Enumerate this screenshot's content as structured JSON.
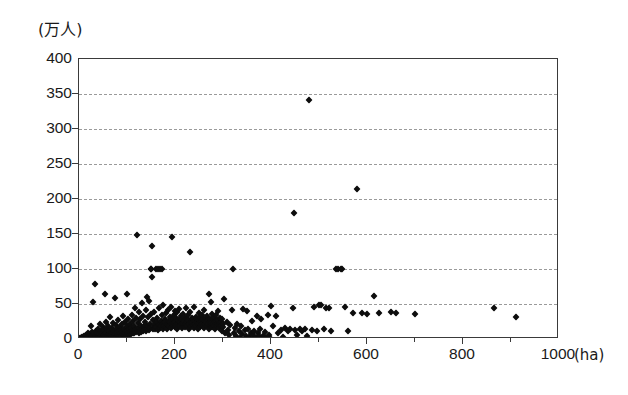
{
  "chart_data": {
    "type": "scatter",
    "title": "",
    "subtitle": "",
    "xlabel": "(ha)",
    "ylabel": "(万人)",
    "x_unit": "ha",
    "y_unit": "万人",
    "xlim": [
      0,
      1000
    ],
    "ylim": [
      0,
      400
    ],
    "x_ticks": [
      0,
      200,
      400,
      600,
      800,
      1000
    ],
    "x_tick_labels": [
      "0",
      "200",
      "400",
      "600",
      "800",
      "1000"
    ],
    "y_ticks": [
      0,
      50,
      100,
      150,
      200,
      250,
      300,
      350,
      400
    ],
    "y_tick_labels": [
      "0",
      "50",
      "100",
      "150",
      "200",
      "250",
      "300",
      "350",
      "400"
    ],
    "x_minor_ticks": [
      100,
      300,
      500,
      700,
      900
    ],
    "grid": true,
    "grid_axis": "y",
    "grid_style": "dashed",
    "grid_color": "#9a9a9a",
    "legend": null,
    "legend_position": "none",
    "marker": "diamond",
    "marker_color": "#0d0d0d",
    "marker_size": 5,
    "frame_color": "#3a3a3a",
    "background": "#ffffff",
    "n_points": 420,
    "notable_outliers": [
      {
        "x": 480,
        "y": 341
      },
      {
        "x": 580,
        "y": 215
      },
      {
        "x": 447,
        "y": 180
      },
      {
        "x": 121,
        "y": 148
      },
      {
        "x": 193,
        "y": 146
      },
      {
        "x": 152,
        "y": 133
      },
      {
        "x": 232,
        "y": 124
      }
    ],
    "points": [
      [
        3,
        1
      ],
      [
        5,
        2
      ],
      [
        6,
        1
      ],
      [
        7,
        3
      ],
      [
        8,
        1
      ],
      [
        9,
        2
      ],
      [
        10,
        4
      ],
      [
        11,
        1
      ],
      [
        12,
        3
      ],
      [
        13,
        2
      ],
      [
        14,
        6
      ],
      [
        15,
        1
      ],
      [
        16,
        4
      ],
      [
        17,
        2
      ],
      [
        18,
        8
      ],
      [
        19,
        3
      ],
      [
        20,
        2
      ],
      [
        21,
        5
      ],
      [
        22,
        1
      ],
      [
        23,
        7
      ],
      [
        24,
        3
      ],
      [
        25,
        18
      ],
      [
        26,
        2
      ],
      [
        27,
        10
      ],
      [
        28,
        4
      ],
      [
        29,
        6
      ],
      [
        30,
        53
      ],
      [
        31,
        3
      ],
      [
        32,
        9
      ],
      [
        33,
        2
      ],
      [
        34,
        79
      ],
      [
        35,
        5
      ],
      [
        36,
        12
      ],
      [
        37,
        3
      ],
      [
        38,
        8
      ],
      [
        39,
        2
      ],
      [
        40,
        15
      ],
      [
        41,
        4
      ],
      [
        42,
        7
      ],
      [
        43,
        3
      ],
      [
        44,
        22
      ],
      [
        45,
        6
      ],
      [
        46,
        11
      ],
      [
        47,
        2
      ],
      [
        48,
        9
      ],
      [
        49,
        4
      ],
      [
        50,
        17
      ],
      [
        51,
        3
      ],
      [
        52,
        13
      ],
      [
        53,
        6
      ],
      [
        54,
        64
      ],
      [
        55,
        4
      ],
      [
        56,
        25
      ],
      [
        57,
        8
      ],
      [
        58,
        5
      ],
      [
        59,
        14
      ],
      [
        60,
        3
      ],
      [
        61,
        19
      ],
      [
        62,
        7
      ],
      [
        63,
        11
      ],
      [
        64,
        5
      ],
      [
        65,
        31
      ],
      [
        66,
        9
      ],
      [
        67,
        6
      ],
      [
        68,
        16
      ],
      [
        69,
        4
      ],
      [
        70,
        23
      ],
      [
        71,
        8
      ],
      [
        72,
        12
      ],
      [
        73,
        5
      ],
      [
        74,
        58
      ],
      [
        75,
        10
      ],
      [
        76,
        7
      ],
      [
        77,
        20
      ],
      [
        78,
        3
      ],
      [
        79,
        14
      ],
      [
        80,
        9
      ],
      [
        81,
        6
      ],
      [
        82,
        27
      ],
      [
        83,
        11
      ],
      [
        84,
        5
      ],
      [
        85,
        17
      ],
      [
        86,
        8
      ],
      [
        87,
        13
      ],
      [
        88,
        4
      ],
      [
        89,
        21
      ],
      [
        90,
        10
      ],
      [
        91,
        7
      ],
      [
        92,
        33
      ],
      [
        93,
        15
      ],
      [
        94,
        6
      ],
      [
        95,
        24
      ],
      [
        96,
        9
      ],
      [
        97,
        12
      ],
      [
        98,
        5
      ],
      [
        99,
        18
      ],
      [
        100,
        65
      ],
      [
        101,
        11
      ],
      [
        102,
        8
      ],
      [
        103,
        29
      ],
      [
        104,
        14
      ],
      [
        105,
        6
      ],
      [
        106,
        22
      ],
      [
        107,
        10
      ],
      [
        108,
        16
      ],
      [
        109,
        7
      ],
      [
        110,
        35
      ],
      [
        111,
        12
      ],
      [
        112,
        9
      ],
      [
        113,
        26
      ],
      [
        114,
        18
      ],
      [
        115,
        8
      ],
      [
        116,
        45
      ],
      [
        117,
        13
      ],
      [
        118,
        10
      ],
      [
        119,
        30
      ],
      [
        120,
        15
      ],
      [
        121,
        148
      ],
      [
        122,
        11
      ],
      [
        123,
        23
      ],
      [
        124,
        9
      ],
      [
        125,
        38
      ],
      [
        126,
        16
      ],
      [
        127,
        12
      ],
      [
        128,
        28
      ],
      [
        129,
        19
      ],
      [
        130,
        10
      ],
      [
        131,
        52
      ],
      [
        132,
        14
      ],
      [
        133,
        11
      ],
      [
        134,
        33
      ],
      [
        135,
        17
      ],
      [
        136,
        13
      ],
      [
        137,
        25
      ],
      [
        138,
        20
      ],
      [
        139,
        12
      ],
      [
        140,
        41
      ],
      [
        141,
        15
      ],
      [
        142,
        60
      ],
      [
        143,
        31
      ],
      [
        144,
        18
      ],
      [
        145,
        13
      ],
      [
        146,
        55
      ],
      [
        147,
        21
      ],
      [
        148,
        16
      ],
      [
        149,
        36
      ],
      [
        150,
        100
      ],
      [
        151,
        100
      ],
      [
        152,
        133
      ],
      [
        153,
        88
      ],
      [
        154,
        14
      ],
      [
        155,
        27
      ],
      [
        156,
        19
      ],
      [
        157,
        39
      ],
      [
        158,
        22
      ],
      [
        159,
        15
      ],
      [
        160,
        100
      ],
      [
        161,
        17
      ],
      [
        162,
        30
      ],
      [
        163,
        24
      ],
      [
        164,
        13
      ],
      [
        165,
        100
      ],
      [
        166,
        20
      ],
      [
        167,
        44
      ],
      [
        168,
        16
      ],
      [
        169,
        100
      ],
      [
        170,
        26
      ],
      [
        171,
        18
      ],
      [
        172,
        34
      ],
      [
        173,
        100
      ],
      [
        174,
        21
      ],
      [
        175,
        15
      ],
      [
        176,
        48
      ],
      [
        177,
        23
      ],
      [
        178,
        19
      ],
      [
        179,
        29
      ],
      [
        180,
        25
      ],
      [
        181,
        17
      ],
      [
        182,
        37
      ],
      [
        183,
        22
      ],
      [
        184,
        14
      ],
      [
        185,
        42
      ],
      [
        186,
        20
      ],
      [
        187,
        26
      ],
      [
        188,
        18
      ],
      [
        189,
        32
      ],
      [
        190,
        24
      ],
      [
        191,
        16
      ],
      [
        192,
        46
      ],
      [
        193,
        146
      ],
      [
        194,
        21
      ],
      [
        195,
        28
      ],
      [
        196,
        19
      ],
      [
        197,
        35
      ],
      [
        198,
        23
      ],
      [
        199,
        17
      ],
      [
        200,
        40
      ],
      [
        201,
        25
      ],
      [
        202,
        30
      ],
      [
        203,
        20
      ],
      [
        204,
        15
      ],
      [
        205,
        38
      ],
      [
        206,
        22
      ],
      [
        207,
        27
      ],
      [
        208,
        18
      ],
      [
        209,
        43
      ],
      [
        210,
        24
      ],
      [
        211,
        19
      ],
      [
        212,
        33
      ],
      [
        213,
        28
      ],
      [
        214,
        21
      ],
      [
        215,
        16
      ],
      [
        216,
        36
      ],
      [
        217,
        23
      ],
      [
        218,
        31
      ],
      [
        219,
        26
      ],
      [
        220,
        20
      ],
      [
        221,
        17
      ],
      [
        222,
        45
      ],
      [
        223,
        22
      ],
      [
        224,
        29
      ],
      [
        225,
        24
      ],
      [
        226,
        18
      ],
      [
        227,
        34
      ],
      [
        228,
        27
      ],
      [
        229,
        21
      ],
      [
        230,
        15
      ],
      [
        231,
        39
      ],
      [
        232,
        124
      ],
      [
        233,
        25
      ],
      [
        234,
        19
      ],
      [
        235,
        30
      ],
      [
        236,
        23
      ],
      [
        237,
        28
      ],
      [
        238,
        20
      ],
      [
        239,
        16
      ],
      [
        240,
        46
      ],
      [
        241,
        26
      ],
      [
        242,
        22
      ],
      [
        243,
        32
      ],
      [
        244,
        18
      ],
      [
        245,
        24
      ],
      [
        246,
        29
      ],
      [
        247,
        21
      ],
      [
        248,
        14
      ],
      [
        249,
        37
      ],
      [
        250,
        27
      ],
      [
        251,
        23
      ],
      [
        252,
        17
      ],
      [
        253,
        31
      ],
      [
        254,
        25
      ],
      [
        255,
        20
      ],
      [
        256,
        35
      ],
      [
        257,
        22
      ],
      [
        258,
        28
      ],
      [
        259,
        19
      ],
      [
        260,
        16
      ],
      [
        261,
        42
      ],
      [
        262,
        26
      ],
      [
        263,
        21
      ],
      [
        264,
        30
      ],
      [
        265,
        24
      ],
      [
        266,
        18
      ],
      [
        267,
        33
      ],
      [
        268,
        27
      ],
      [
        269,
        22
      ],
      [
        270,
        65
      ],
      [
        271,
        15
      ],
      [
        272,
        29
      ],
      [
        273,
        25
      ],
      [
        274,
        20
      ],
      [
        275,
        53
      ],
      [
        276,
        23
      ],
      [
        277,
        17
      ],
      [
        278,
        36
      ],
      [
        279,
        28
      ],
      [
        280,
        21
      ],
      [
        281,
        19
      ],
      [
        282,
        31
      ],
      [
        283,
        24
      ],
      [
        284,
        14
      ],
      [
        285,
        34
      ],
      [
        286,
        26
      ],
      [
        287,
        22
      ],
      [
        288,
        18
      ],
      [
        289,
        40
      ],
      [
        290,
        27
      ],
      [
        291,
        20
      ],
      [
        292,
        16
      ],
      [
        293,
        30
      ],
      [
        294,
        23
      ],
      [
        295,
        25
      ],
      [
        296,
        19
      ],
      [
        297,
        12
      ],
      [
        298,
        28
      ],
      [
        299,
        21
      ],
      [
        300,
        17
      ],
      [
        302,
        57
      ],
      [
        305,
        9
      ],
      [
        308,
        24
      ],
      [
        310,
        13
      ],
      [
        312,
        6
      ],
      [
        315,
        20
      ],
      [
        318,
        41
      ],
      [
        320,
        100
      ],
      [
        322,
        8
      ],
      [
        325,
        16
      ],
      [
        328,
        4
      ],
      [
        330,
        22
      ],
      [
        333,
        11
      ],
      [
        335,
        2
      ],
      [
        338,
        18
      ],
      [
        340,
        7
      ],
      [
        342,
        43
      ],
      [
        345,
        13
      ],
      [
        348,
        5
      ],
      [
        350,
        40
      ],
      [
        352,
        15
      ],
      [
        355,
        3
      ],
      [
        358,
        9
      ],
      [
        360,
        26
      ],
      [
        363,
        6
      ],
      [
        365,
        12
      ],
      [
        368,
        2
      ],
      [
        370,
        33
      ],
      [
        373,
        8
      ],
      [
        375,
        4
      ],
      [
        378,
        14
      ],
      [
        380,
        29
      ],
      [
        383,
        5
      ],
      [
        385,
        3
      ],
      [
        388,
        10
      ],
      [
        390,
        1
      ],
      [
        393,
        35
      ],
      [
        395,
        6
      ],
      [
        398,
        2
      ],
      [
        400,
        47
      ],
      [
        405,
        18
      ],
      [
        410,
        33
      ],
      [
        415,
        8
      ],
      [
        420,
        13
      ],
      [
        425,
        3
      ],
      [
        430,
        16
      ],
      [
        435,
        11
      ],
      [
        440,
        14
      ],
      [
        445,
        45
      ],
      [
        447,
        180
      ],
      [
        450,
        13
      ],
      [
        455,
        6
      ],
      [
        460,
        15
      ],
      [
        465,
        12
      ],
      [
        470,
        14
      ],
      [
        475,
        5
      ],
      [
        480,
        341
      ],
      [
        485,
        13
      ],
      [
        490,
        46
      ],
      [
        495,
        12
      ],
      [
        500,
        49
      ],
      [
        505,
        48
      ],
      [
        510,
        14
      ],
      [
        515,
        45
      ],
      [
        520,
        44
      ],
      [
        525,
        12
      ],
      [
        535,
        100
      ],
      [
        540,
        100
      ],
      [
        545,
        100
      ],
      [
        548,
        100
      ],
      [
        555,
        46
      ],
      [
        560,
        11
      ],
      [
        570,
        37
      ],
      [
        580,
        215
      ],
      [
        590,
        37
      ],
      [
        600,
        36
      ],
      [
        615,
        61
      ],
      [
        625,
        37
      ],
      [
        650,
        38
      ],
      [
        660,
        37
      ],
      [
        700,
        36
      ],
      [
        865,
        44
      ],
      [
        910,
        31
      ]
    ]
  }
}
